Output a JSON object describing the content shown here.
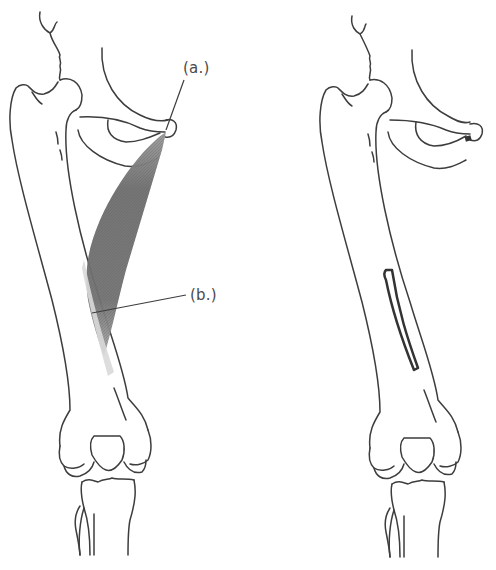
{
  "figure": {
    "panels": [
      {
        "id": "left",
        "description": "Femur and pelvis with muscle shown",
        "labels": [
          {
            "id": "a",
            "text": "(a.)"
          },
          {
            "id": "b",
            "text": "(b.)"
          }
        ]
      },
      {
        "id": "right",
        "description": "Femur and pelvis with attachment sites outlined"
      }
    ],
    "colors": {
      "outline": "#3d3d3d",
      "bone_fill": "#ffffff",
      "muscle_dark": "#6e6e6e",
      "muscle_light": "#c8c8c8",
      "tendon": "#d9d9d9",
      "attachment_marker": "#333333",
      "label_text": "#4a4a4a"
    }
  }
}
